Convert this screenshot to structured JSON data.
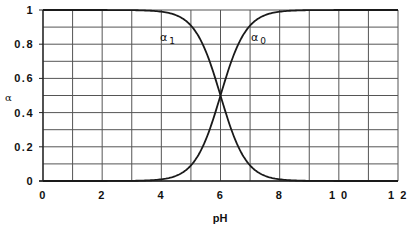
{
  "chart_data": {
    "type": "line",
    "title": "",
    "xlabel": "pH",
    "ylabel": "α",
    "xlim": [
      0,
      12
    ],
    "ylim": [
      0,
      1
    ],
    "x_ticks": [
      "0",
      "2",
      "4",
      "6",
      "8",
      "1 0",
      "1 2"
    ],
    "x_tick_values": [
      0,
      2,
      4,
      6,
      8,
      10,
      12
    ],
    "y_ticks": [
      "0",
      "0.2",
      "0.4",
      "0.6",
      "0.8",
      "1"
    ],
    "y_tick_values": [
      0,
      0.2,
      0.4,
      0.6,
      0.8,
      1
    ],
    "grid": true,
    "x_grid_step": 1,
    "y_grid_step": 0.1,
    "legend": "none (inline curve labels)",
    "pKa": 6,
    "x": [
      0,
      1,
      2,
      3,
      4,
      4.5,
      5,
      5.5,
      6,
      6.5,
      7,
      7.5,
      8,
      9,
      10,
      11,
      12
    ],
    "series": [
      {
        "name": "α1",
        "label_base": "α",
        "label_sub": "1",
        "values": [
          1.0,
          1.0,
          1.0,
          0.999,
          0.99,
          0.969,
          0.909,
          0.76,
          0.5,
          0.24,
          0.091,
          0.031,
          0.01,
          0.001,
          0.0,
          0.0,
          0.0
        ]
      },
      {
        "name": "α0",
        "label_base": "α",
        "label_sub": "0",
        "values": [
          0.0,
          0.0,
          0.0,
          0.001,
          0.01,
          0.031,
          0.091,
          0.24,
          0.5,
          0.76,
          0.909,
          0.969,
          0.99,
          0.999,
          1.0,
          1.0,
          1.0
        ]
      }
    ],
    "annotations": [
      {
        "text": "α1",
        "x": 4.2,
        "y": 0.83
      },
      {
        "text": "α0",
        "x": 7.2,
        "y": 0.83
      }
    ]
  },
  "colors": {
    "grid": "#555555",
    "curve": "#1a1a1a",
    "background": "#ffffff"
  }
}
